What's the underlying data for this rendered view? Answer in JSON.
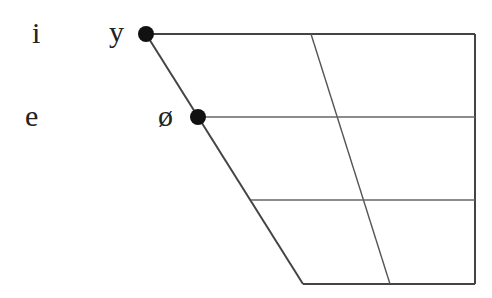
{
  "diagram": {
    "row_labels_unrounded": [
      {
        "symbol": "i",
        "height": "close"
      },
      {
        "symbol": "e",
        "height": "close-mid"
      }
    ],
    "points": [
      {
        "symbol": "y",
        "height": "close",
        "position": "front",
        "rounded": true
      },
      {
        "symbol": "ø",
        "height": "close-mid",
        "position": "front",
        "rounded": true
      }
    ],
    "colors": {
      "line": "#333333",
      "point": "#111111",
      "text": "#222222"
    }
  }
}
